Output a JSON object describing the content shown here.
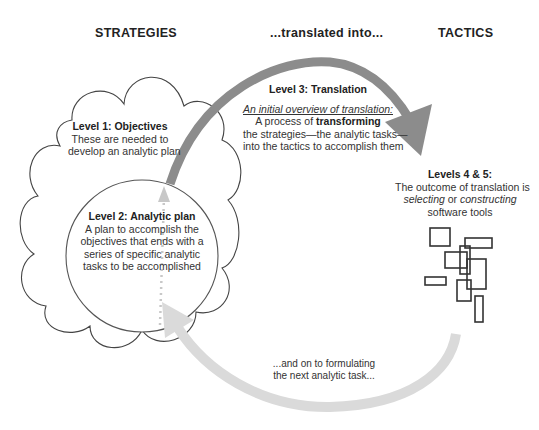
{
  "headers": {
    "strategies": "STRATEGIES",
    "translated": "...translated into...",
    "tactics": "TACTICS"
  },
  "level1": {
    "title": "Level 1: Objectives",
    "lines": [
      "These are needed to",
      "develop an analytic plan"
    ]
  },
  "level2": {
    "title": "Level 2: Analytic plan",
    "lines": [
      "A plan to accomplish the",
      "objectives that ends with a",
      "series of specific analytic",
      "tasks to be accomplished"
    ]
  },
  "level3": {
    "title": "Level 3: Translation",
    "overview": "An initial overview of translation:",
    "line1_prefix": "A process of ",
    "line1_bold": "transforming",
    "line2": "the strategies—the analytic tasks—",
    "line3": "into the tactics to accomplish them"
  },
  "levels45": {
    "title": "Levels 4 & 5:",
    "line1": "The outcome of translation is",
    "line2_italic1": "selecting",
    "line2_mid": " or ",
    "line2_italic2": "constructing",
    "line3": "software tools"
  },
  "loop_back": {
    "lines": [
      "...and on to formulating",
      "the next analytic task..."
    ]
  },
  "colors": {
    "top_arrow": "#8c8c8c",
    "bottom_arrow": "#dadada",
    "dotted_arrow": "#c8c8c8",
    "outline": "#444444"
  }
}
